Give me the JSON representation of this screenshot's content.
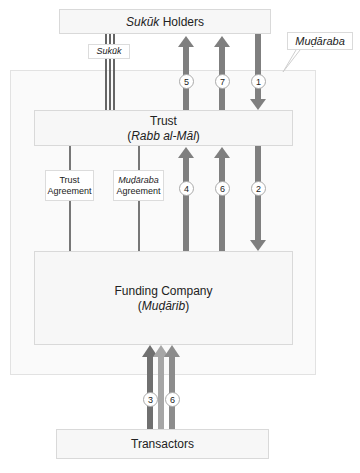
{
  "diagram": {
    "nodes": {
      "sukuk_holders": {
        "italic": "Sukūk",
        "rest": " Holders"
      },
      "trust": {
        "line1": "Trust",
        "open": "(",
        "italic": "Rabb al-Māl",
        "close": ")"
      },
      "funding_company": {
        "line1": "Funding Company",
        "open": "(",
        "italic": "Muḍārib",
        "close": ")"
      },
      "transactors": {
        "label": "Transactors"
      }
    },
    "callout": {
      "label": "Muḍāraba"
    },
    "labels": {
      "sukuk": "Sukūk",
      "trust_agreement": {
        "line1": "Trust",
        "line2": "Agreement"
      },
      "mudaraba_agreement": {
        "line1": "Muḍāraba",
        "line2": "Agreement"
      }
    },
    "steps": {
      "s1": "1",
      "s2": "2",
      "s3": "3",
      "s4": "4",
      "s5": "5",
      "s6a": "6",
      "s6b": "6",
      "s7": "7"
    },
    "colors": {
      "arrow_dark": "#7a7a7a",
      "arrow_mid": "#8e8e8e",
      "arrow_light": "#a8a8a8",
      "box_fill": "#f7f7f7",
      "box_border": "#d9d9d9"
    }
  }
}
